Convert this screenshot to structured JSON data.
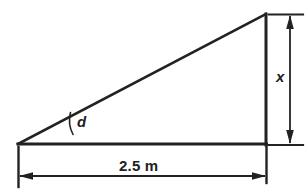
{
  "figure": {
    "kind": "right-triangle-dimension-diagram",
    "background_color": "#ffffff",
    "stroke_color": "#222222",
    "labels": {
      "base_dimension": "2.5 m",
      "height_dimension": "x",
      "angle": "d"
    },
    "geometry": {
      "left_vertex": [
        18,
        144
      ],
      "right_vertex": [
        266,
        144
      ],
      "apex": [
        266,
        14
      ],
      "base_length_label": "2.5 m",
      "height_label": "x",
      "angle_label": "d"
    },
    "dimension_lines": {
      "horizontal": {
        "label": "2.5 m",
        "y": 176,
        "x_start": 18,
        "x_end": 266,
        "arrow_style": "double-headed"
      },
      "vertical": {
        "label": "x",
        "x": 290,
        "y_start": 14,
        "y_end": 144,
        "arrow_style": "double-headed"
      }
    }
  }
}
